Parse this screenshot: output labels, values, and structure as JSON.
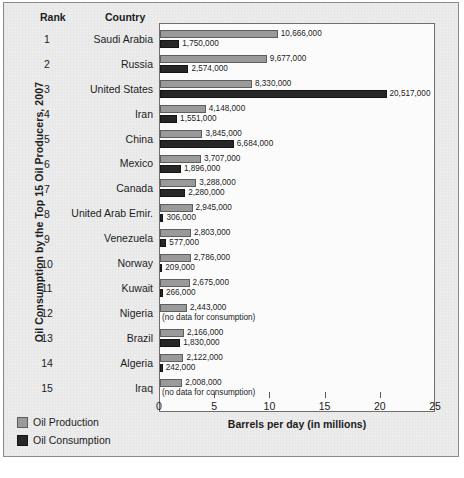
{
  "figure": {
    "vertical_title": "Oil Consumption by the Top 15 Oil Producers, 2007",
    "column_headers": {
      "rank": "Rank",
      "country": "Country"
    },
    "colors": {
      "production": "#9a9a9a",
      "consumption": "#272727",
      "plot_background": "#fbfbfb",
      "page_background": "#ececed"
    }
  },
  "legend": {
    "position": "bottom-left",
    "items": [
      {
        "label": "Oil Production",
        "swatch": "production-swatch"
      },
      {
        "label": "Oil Consumption",
        "swatch": "consumption-swatch"
      }
    ]
  },
  "chart_data": {
    "type": "bar",
    "orientation": "horizontal",
    "title": "Oil Consumption by the Top 15 Oil Producers, 2007",
    "xlabel": "Barrels per day (in millions)",
    "ylabel": "",
    "xlim": [
      0,
      25
    ],
    "xticks": [
      0,
      5,
      10,
      15,
      20,
      25
    ],
    "xtick_labels": [
      "0",
      "5",
      "10",
      "15",
      "20",
      "25"
    ],
    "grid": false,
    "legend_position": "bottom-left",
    "units": "barrels per day",
    "value_scale": 1000000,
    "categories": [
      "Saudi Arabia",
      "Russia",
      "United States",
      "Iran",
      "China",
      "Mexico",
      "Canada",
      "United Arab Emir.",
      "Venezuela",
      "Norway",
      "Kuwait",
      "Nigeria",
      "Brazil",
      "Algeria",
      "Iraq"
    ],
    "ranks": [
      "1",
      "2",
      "3",
      "4",
      "5",
      "6",
      "7",
      "8",
      "9",
      "10",
      "11",
      "12",
      "13",
      "14",
      "15"
    ],
    "series": [
      {
        "name": "Oil Production",
        "color": "#9a9a9a",
        "values": [
          10666000,
          9677000,
          8330000,
          4148000,
          3845000,
          3707000,
          3288000,
          2945000,
          2803000,
          2786000,
          2675000,
          2443000,
          2166000,
          2122000,
          2008000
        ],
        "labels": [
          "10,666,000",
          "9,677,000",
          "8,330,000",
          "4,148,000",
          "3,845,000",
          "3,707,000",
          "3,288,000",
          "2,945,000",
          "2,803,000",
          "2,786,000",
          "2,675,000",
          "2,443,000",
          "2,166,000",
          "2,122,000",
          "2,008,000"
        ]
      },
      {
        "name": "Oil Consumption",
        "color": "#272727",
        "values": [
          1750000,
          2574000,
          20517000,
          1551000,
          6684000,
          1896000,
          2280000,
          306000,
          577000,
          209000,
          266000,
          null,
          1830000,
          242000,
          null
        ],
        "labels": [
          "1,750,000",
          "2,574,000",
          "20,517,000",
          "1,551,000",
          "6,684,000",
          "1,896,000",
          "2,280,000",
          "306,000",
          "577,000",
          "209,000",
          "266,000",
          "(no data for consumption)",
          "1,830,000",
          "242,000",
          "(no data for consumption)"
        ]
      }
    ],
    "rows": [
      {
        "rank": "1",
        "country": "Saudi Arabia",
        "production": 10666000,
        "production_label": "10,666,000",
        "consumption": 1750000,
        "consumption_label": "1,750,000"
      },
      {
        "rank": "2",
        "country": "Russia",
        "production": 9677000,
        "production_label": "9,677,000",
        "consumption": 2574000,
        "consumption_label": "2,574,000"
      },
      {
        "rank": "3",
        "country": "United States",
        "production": 8330000,
        "production_label": "8,330,000",
        "consumption": 20517000,
        "consumption_label": "20,517,000"
      },
      {
        "rank": "4",
        "country": "Iran",
        "production": 4148000,
        "production_label": "4,148,000",
        "consumption": 1551000,
        "consumption_label": "1,551,000"
      },
      {
        "rank": "5",
        "country": "China",
        "production": 3845000,
        "production_label": "3,845,000",
        "consumption": 6684000,
        "consumption_label": "6,684,000"
      },
      {
        "rank": "6",
        "country": "Mexico",
        "production": 3707000,
        "production_label": "3,707,000",
        "consumption": 1896000,
        "consumption_label": "1,896,000"
      },
      {
        "rank": "7",
        "country": "Canada",
        "production": 3288000,
        "production_label": "3,288,000",
        "consumption": 2280000,
        "consumption_label": "2,280,000"
      },
      {
        "rank": "8",
        "country": "United Arab Emir.",
        "production": 2945000,
        "production_label": "2,945,000",
        "consumption": 306000,
        "consumption_label": "306,000"
      },
      {
        "rank": "9",
        "country": "Venezuela",
        "production": 2803000,
        "production_label": "2,803,000",
        "consumption": 577000,
        "consumption_label": "577,000"
      },
      {
        "rank": "10",
        "country": "Norway",
        "production": 2786000,
        "production_label": "2,786,000",
        "consumption": 209000,
        "consumption_label": "209,000"
      },
      {
        "rank": "11",
        "country": "Kuwait",
        "production": 2675000,
        "production_label": "2,675,000",
        "consumption": 266000,
        "consumption_label": "266,000"
      },
      {
        "rank": "12",
        "country": "Nigeria",
        "production": 2443000,
        "production_label": "2,443,000",
        "consumption": null,
        "consumption_label": "(no data for consumption)"
      },
      {
        "rank": "13",
        "country": "Brazil",
        "production": 2166000,
        "production_label": "2,166,000",
        "consumption": 1830000,
        "consumption_label": "1,830,000"
      },
      {
        "rank": "14",
        "country": "Algeria",
        "production": 2122000,
        "production_label": "2,122,000",
        "consumption": 242000,
        "consumption_label": "242,000"
      },
      {
        "rank": "15",
        "country": "Iraq",
        "production": 2008000,
        "production_label": "2,008,000",
        "consumption": null,
        "consumption_label": "(no data for consumption)"
      }
    ]
  }
}
